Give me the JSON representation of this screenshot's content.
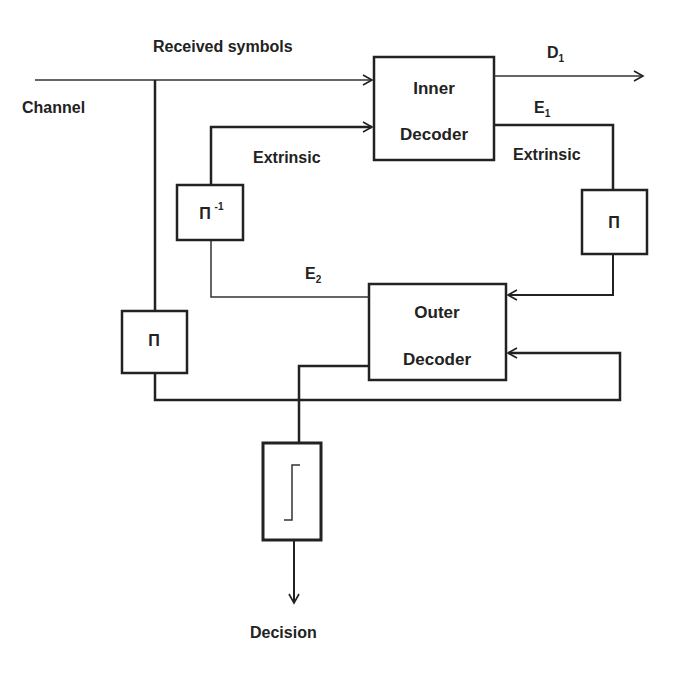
{
  "diagram": {
    "colors": {
      "line": "#222222",
      "background": "#ffffff"
    },
    "labels": {
      "received_symbols": "Received symbols",
      "channel": "Channel",
      "d1": "D",
      "d1_sub": "1",
      "e1": "E",
      "e1_sub": "1",
      "e2": "E",
      "e2_sub": "2",
      "extrinsic_left": "Extrinsic",
      "extrinsic_right": "Extrinsic",
      "decision": "Decision"
    },
    "blocks": {
      "inner_decoder": {
        "line1": "Inner",
        "line2": "Decoder"
      },
      "outer_decoder": {
        "line1": "Outer",
        "line2": "Decoder"
      },
      "deinterleaver": {
        "symbol": "Π",
        "superscript": "-1"
      },
      "interleaver_right": {
        "symbol": "Π"
      },
      "interleaver_left": {
        "symbol": "Π"
      },
      "hard_decision": {
        "icon": "step-function-icon"
      }
    }
  }
}
